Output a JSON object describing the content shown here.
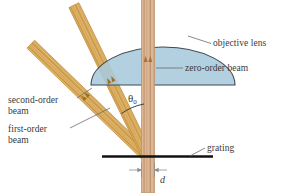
{
  "figure": {
    "background_color": "#ffffff"
  },
  "labels": {
    "objective_lens": "objective lens",
    "zero_order_beam": "zero-order beam",
    "second_order_beam": "second-order\nbeam",
    "first_order_beam": "first-order\nbeam",
    "grating": "grating",
    "theta_symbol": "θ",
    "theta_subscript": "0",
    "spacing_d": "d"
  },
  "colors": {
    "lens_fill": "#a9c9dc",
    "lens_stroke": "#3c4a52",
    "beam_vertical_fill": "#dcb896",
    "beam_vertical_stroke": "#b98a62",
    "beam_angled_fill": "#e0b25f",
    "beam_angled_stroke": "#b9853a",
    "grating_line": "#111111",
    "leader_line": "#6b6b6b",
    "text": "#3a3a3a"
  },
  "geometry": {
    "grating_point_x": 148,
    "grating_point_y": 156,
    "grating_line_y": 156,
    "grating_line_x1": 102,
    "grating_line_x2": 213,
    "zero_order_angle_deg": 0,
    "first_order_angle_deg": 26,
    "second_order_angle_deg": 46,
    "lens_center_x": 163,
    "lens_center_y": 47,
    "lens_radius_x": 72,
    "lens_radius_y": 38,
    "beam_width_vertical": 13,
    "beam_width_angled": 11,
    "d_arrow_y": 170
  }
}
